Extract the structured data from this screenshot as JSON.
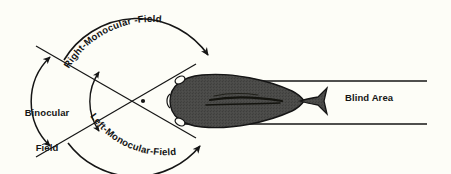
{
  "figure": {
    "background_color": "#fdfdf7",
    "ink_color": "#151515",
    "body_fill_color": "#4a4a48"
  },
  "labels": {
    "binocular_field_line1": "Binocular",
    "binocular_field_line2": "Field",
    "right_monocular_field": "Right-Monocular -Field",
    "left_monocular_field": "Left-Monocular-Field",
    "blind_area": "Blind Area"
  },
  "diagram": {
    "vertex_x": 143,
    "vertex_y": 101,
    "eye_left_x": 181,
    "eye_left_y": 79,
    "eye_right_x": 181,
    "eye_right_y": 121,
    "blind_area_top_y": 81,
    "blind_area_bottom_y": 124,
    "blind_area_end_x": 427
  }
}
